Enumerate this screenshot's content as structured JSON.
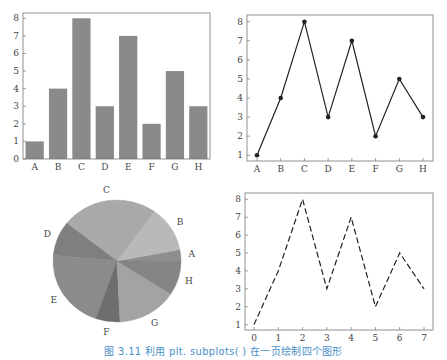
{
  "caption": "图 3.11   利用 plt. subplots( )  在一页绘制四个图形",
  "chart_data": [
    {
      "type": "bar",
      "position": "top-left",
      "categories": [
        "A",
        "B",
        "C",
        "D",
        "E",
        "F",
        "G",
        "H"
      ],
      "values": [
        1,
        4,
        8,
        3,
        7,
        2,
        5,
        3
      ],
      "yticks": [
        0,
        1,
        2,
        3,
        4,
        5,
        6,
        7,
        8
      ],
      "ylim": [
        0,
        8.3
      ],
      "color": "#8a8a8a",
      "grid": false
    },
    {
      "type": "line",
      "position": "top-right",
      "categories": [
        "A",
        "B",
        "C",
        "D",
        "E",
        "F",
        "G",
        "H"
      ],
      "values": [
        1,
        4,
        8,
        3,
        7,
        2,
        5,
        3
      ],
      "yticks": [
        1,
        2,
        3,
        4,
        5,
        6,
        7,
        8
      ],
      "ylim": [
        0.7,
        8.35
      ],
      "marker": "o",
      "linestyle": "solid",
      "color": "#222222",
      "grid": false
    },
    {
      "type": "pie",
      "position": "bottom-left",
      "labels": [
        "A",
        "B",
        "C",
        "D",
        "E",
        "F",
        "G",
        "H"
      ],
      "values": [
        1,
        4,
        8,
        3,
        7,
        2,
        5,
        3
      ],
      "colors": [
        "#8e8e8e",
        "#b9b9b9",
        "#a9a9a9",
        "#7f7f7f",
        "#8b8b8b",
        "#6e6e6e",
        "#a3a3a3",
        "#858585"
      ]
    },
    {
      "type": "line",
      "position": "bottom-right",
      "x": [
        0,
        1,
        2,
        3,
        4,
        5,
        6,
        7
      ],
      "values": [
        1,
        4,
        8,
        3,
        7,
        2,
        5,
        3
      ],
      "xticks": [
        0,
        1,
        2,
        3,
        4,
        5,
        6,
        7
      ],
      "yticks": [
        1,
        2,
        3,
        4,
        5,
        6,
        7,
        8
      ],
      "ylim": [
        0.7,
        8.35
      ],
      "linestyle": "dashed",
      "color": "#222222",
      "grid": false
    }
  ]
}
